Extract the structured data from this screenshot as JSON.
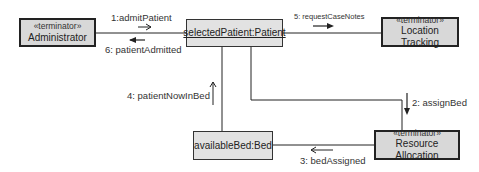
{
  "diagram": {
    "type": "UML communication diagram",
    "nodes": [
      {
        "id": "administrator",
        "stereotype": "«terminator»",
        "name": "Administrator"
      },
      {
        "id": "selected-patient",
        "stereotype": "",
        "name": "selectedPatient:Patient"
      },
      {
        "id": "location-tracking",
        "stereotype": "«terminator»",
        "name": "Location Tracking"
      },
      {
        "id": "available-bed",
        "stereotype": "",
        "name": "availableBed:Bed"
      },
      {
        "id": "resource-allocation",
        "stereotype": "«terminator»",
        "name": "Resource Allocation"
      }
    ],
    "messages": [
      {
        "seq": "1",
        "label": "1:admitPatient",
        "from": "administrator",
        "to": "selected-patient",
        "direction": "right"
      },
      {
        "seq": "2",
        "label": "2: assignBed",
        "from": "selected-patient",
        "to": "resource-allocation",
        "direction": "down"
      },
      {
        "seq": "3",
        "label": "3: bedAssigned",
        "from": "resource-allocation",
        "to": "available-bed",
        "direction": "left"
      },
      {
        "seq": "4",
        "label": "4: patientNowInBed",
        "from": "available-bed",
        "to": "selected-patient",
        "direction": "up"
      },
      {
        "seq": "5",
        "label": "5: requestCaseNotes",
        "from": "selected-patient",
        "to": "location-tracking",
        "direction": "right"
      },
      {
        "seq": "6",
        "label": "6: patientAdmitted",
        "from": "selected-patient",
        "to": "administrator",
        "direction": "left"
      }
    ]
  }
}
